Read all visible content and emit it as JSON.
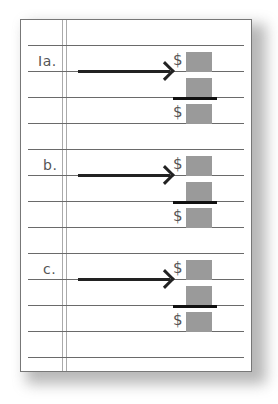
{
  "sections": [
    {
      "label": "Ia.",
      "currency": "$"
    },
    {
      "label": "b.",
      "currency": "$"
    },
    {
      "label": "c.",
      "currency": "$"
    }
  ],
  "colors": {
    "rule": "#6a6a6a",
    "box": "#9a9a9a",
    "arrow": "#222222"
  }
}
